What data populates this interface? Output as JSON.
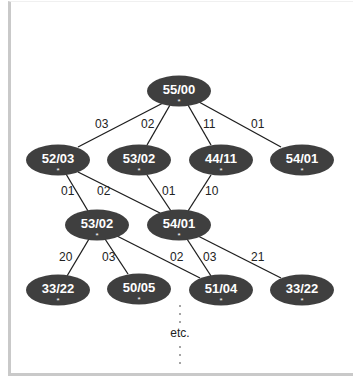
{
  "diagram": {
    "colors": {
      "node_fill": "#3f3f3f",
      "node_text": "#ffffff",
      "edge": "#1e1e1e",
      "frame": "#c9c9c9"
    },
    "nodes": [
      {
        "id": "n0",
        "label": "55/00",
        "marker": "*",
        "cx": 179,
        "cy": 91
      },
      {
        "id": "n1",
        "label": "52/03",
        "marker": "*",
        "cx": 58,
        "cy": 160
      },
      {
        "id": "n2",
        "label": "53/02",
        "marker": "*",
        "cx": 139,
        "cy": 160
      },
      {
        "id": "n3",
        "label": "44/11",
        "marker": "*",
        "cx": 221,
        "cy": 160
      },
      {
        "id": "n4",
        "label": "54/01",
        "marker": "*",
        "cx": 302,
        "cy": 160
      },
      {
        "id": "n5",
        "label": "53/02",
        "marker": "*",
        "cx": 97,
        "cy": 225
      },
      {
        "id": "n6",
        "label": "54/01",
        "marker": "*",
        "cx": 179,
        "cy": 225
      },
      {
        "id": "n7",
        "label": "33/22",
        "marker": "*",
        "cx": 58,
        "cy": 290
      },
      {
        "id": "n8",
        "label": "50/05",
        "marker": "*",
        "cx": 139,
        "cy": 289
      },
      {
        "id": "n9",
        "label": "51/04",
        "marker": "*",
        "cx": 221,
        "cy": 290
      },
      {
        "id": "n10",
        "label": "33/22",
        "marker": "*",
        "cx": 302,
        "cy": 290
      }
    ],
    "edges": [
      {
        "from": "n0",
        "to": "n1",
        "label": "03",
        "x1": 163,
        "y1": 103,
        "x2": 78,
        "y2": 147,
        "lx": 95,
        "ly": 128
      },
      {
        "from": "n0",
        "to": "n2",
        "label": "02",
        "x1": 170,
        "y1": 105,
        "x2": 147,
        "y2": 145,
        "lx": 141,
        "ly": 128
      },
      {
        "from": "n0",
        "to": "n3",
        "label": "11",
        "x1": 188,
        "y1": 105,
        "x2": 211,
        "y2": 145,
        "lx": 203,
        "ly": 128
      },
      {
        "from": "n0",
        "to": "n4",
        "label": "01",
        "x1": 199,
        "y1": 102,
        "x2": 281,
        "y2": 147,
        "lx": 251,
        "ly": 128
      },
      {
        "from": "n1",
        "to": "n5",
        "label": "01",
        "x1": 66,
        "y1": 174,
        "x2": 88,
        "y2": 211,
        "lx": 61,
        "ly": 195
      },
      {
        "from": "n1",
        "to": "n6",
        "label": "02",
        "x1": 78,
        "y1": 172,
        "x2": 160,
        "y2": 213,
        "lx": 97,
        "ly": 195
      },
      {
        "from": "n2",
        "to": "n6",
        "label": "01",
        "x1": 147,
        "y1": 175,
        "x2": 171,
        "y2": 211,
        "lx": 162,
        "ly": 195
      },
      {
        "from": "n3",
        "to": "n6",
        "label": "10",
        "x1": 211,
        "y1": 175,
        "x2": 188,
        "y2": 211,
        "lx": 205,
        "ly": 195
      },
      {
        "from": "n5",
        "to": "n7",
        "label": "20",
        "x1": 89,
        "y1": 239,
        "x2": 67,
        "y2": 276,
        "lx": 59,
        "ly": 261
      },
      {
        "from": "n5",
        "to": "n8",
        "label": "03",
        "x1": 105,
        "y1": 239,
        "x2": 128,
        "y2": 274,
        "lx": 102,
        "ly": 261
      },
      {
        "from": "n5",
        "to": "n9",
        "label": "02",
        "x1": 117,
        "y1": 236,
        "x2": 200,
        "y2": 278,
        "lx": 170,
        "ly": 261
      },
      {
        "from": "n6",
        "to": "n9",
        "label": "03",
        "x1": 187,
        "y1": 239,
        "x2": 211,
        "y2": 276,
        "lx": 203,
        "ly": 261
      },
      {
        "from": "n6",
        "to": "n10",
        "label": "21",
        "x1": 198,
        "y1": 236,
        "x2": 281,
        "y2": 278,
        "lx": 251,
        "ly": 261
      }
    ],
    "continuation": {
      "label": "etc.",
      "x": 180,
      "y": 337,
      "dots_above": [
        306,
        314,
        322
      ],
      "dots_below": [
        347,
        355,
        363
      ]
    }
  }
}
